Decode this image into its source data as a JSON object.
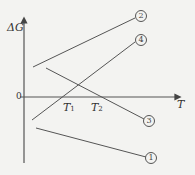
{
  "diagram": {
    "y_axis_label": "ΔG",
    "x_axis_label": "T",
    "origin_label": "0",
    "crossings": [
      {
        "label": "T",
        "sub": "1"
      },
      {
        "label": "T",
        "sub": "2"
      }
    ],
    "lines": [
      {
        "id": "1",
        "marker": "①"
      },
      {
        "id": "2",
        "marker": "②"
      },
      {
        "id": "3",
        "marker": "③"
      },
      {
        "id": "4",
        "marker": "④"
      }
    ]
  }
}
